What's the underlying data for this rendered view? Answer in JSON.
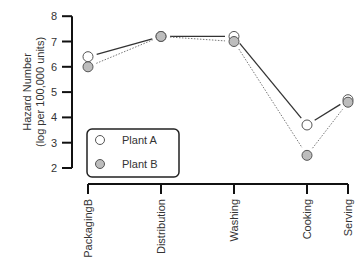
{
  "chart_data": {
    "type": "line",
    "title": "",
    "xlabel": "",
    "ylabel": "Hazard Number",
    "ylabel_line2": "(log per 100,000 units)",
    "categories": [
      "PackagingB",
      "Distribution",
      "Washing",
      "Cooking",
      "Serving"
    ],
    "ylim": [
      2,
      8
    ],
    "yticks": [
      2,
      3,
      4,
      5,
      6,
      7,
      8
    ],
    "grid": false,
    "legend_position": "lower-left inside",
    "series": [
      {
        "name": "Plant A",
        "values": [
          6.4,
          7.2,
          7.2,
          3.7,
          4.7
        ],
        "marker": "open-circle",
        "line": "solid",
        "color": "#333333",
        "fill": "#ffffff"
      },
      {
        "name": "Plant B",
        "values": [
          6.0,
          7.2,
          7.0,
          2.5,
          4.6
        ],
        "marker": "gray-filled-circle",
        "line": "dotted",
        "color": "#777777",
        "fill": "#bdbdbd"
      }
    ]
  },
  "legend": {
    "items": [
      {
        "label": "Plant A"
      },
      {
        "label": "Plant B"
      }
    ]
  },
  "axis": {
    "ylabel": "Hazard Number",
    "ylabel_line2": "(log per 100,000 units)",
    "yticks": [
      "2",
      "3",
      "4",
      "5",
      "6",
      "7",
      "8"
    ],
    "categories": [
      "PackagingB",
      "Distribution",
      "Washing",
      "Cooking",
      "Serving"
    ]
  }
}
